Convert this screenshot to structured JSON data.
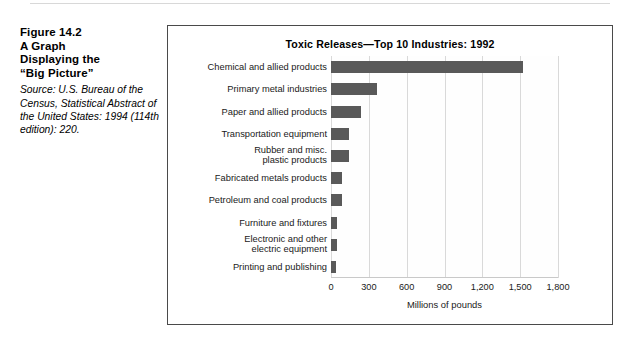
{
  "caption": {
    "title_lines": [
      "Figure 14.2",
      "A Graph",
      "Displaying the",
      "“Big Picture”"
    ],
    "source": "Source: U.S. Bureau of the Census, Statistical Abstract of the United States: 1994 (114th edition): 220."
  },
  "chart_data": {
    "type": "bar",
    "orientation": "horizontal",
    "title": "Toxic Releases—Top 10 Industries: 1992",
    "xlabel": "Millions of pounds",
    "ylabel": "",
    "xlim": [
      0,
      1800
    ],
    "xticks": [
      0,
      300,
      600,
      900,
      1200,
      1500,
      1800
    ],
    "xtick_labels": [
      "0",
      "300",
      "600",
      "900",
      "1,200",
      "1,500",
      "1,800"
    ],
    "grid": true,
    "legend": "none",
    "bar_color": "#595959",
    "categories": [
      "Chemical and allied products",
      "Primary metal industries",
      "Paper and allied products",
      "Transportation equipment",
      "Rubber and misc.\nplastic products",
      "Fabricated metals products",
      "Petroleum and coal products",
      "Furniture and fixtures",
      "Electronic and other\nelectric equipment",
      "Printing and publishing"
    ],
    "values": [
      1525,
      365,
      240,
      145,
      140,
      90,
      85,
      45,
      45,
      40
    ]
  }
}
